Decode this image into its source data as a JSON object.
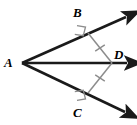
{
  "figure": {
    "kind": "geometry-diagram",
    "width": 137,
    "height": 125,
    "background_color": "#ffffff",
    "ray_color": "#1a1a1a",
    "segment_color": "#8c8c8c",
    "mark_color": "#8c8c8c",
    "label_color": "#000000"
  },
  "points": {
    "A": {
      "label": "A",
      "x": 22,
      "y": 63
    },
    "B": {
      "label": "B",
      "x": 88,
      "y": 33
    },
    "C": {
      "label": "C",
      "x": 88,
      "y": 93
    },
    "D": {
      "label": "D",
      "x": 112,
      "y": 63
    }
  },
  "rays": [
    {
      "name": "ray-AB",
      "from": "A",
      "through": "B",
      "x1": 22,
      "y1": 63,
      "x2": 131,
      "y2": 14,
      "arrow": true
    },
    {
      "name": "ray-AD",
      "from": "A",
      "through": "D",
      "x1": 22,
      "y1": 63,
      "x2": 133,
      "y2": 63,
      "arrow": true
    },
    {
      "name": "ray-AC",
      "from": "A",
      "through": "C",
      "x1": 22,
      "y1": 63,
      "x2": 131,
      "y2": 115,
      "arrow": true
    }
  ],
  "segments": [
    {
      "name": "segment-BD",
      "from": "B",
      "to": "D",
      "x1": 88,
      "y1": 33,
      "x2": 112,
      "y2": 63,
      "ticks": 1,
      "congruent": true
    },
    {
      "name": "segment-CD",
      "from": "C",
      "to": "D",
      "x1": 88,
      "y1": 93,
      "x2": 112,
      "y2": 63,
      "ticks": 1,
      "congruent": true
    }
  ],
  "right_angles": [
    {
      "name": "right-angle-at-B",
      "at": "B",
      "x": 88,
      "y": 33,
      "measure": 90
    },
    {
      "name": "right-angle-at-C",
      "at": "C",
      "x": 88,
      "y": 93,
      "measure": 90
    }
  ],
  "labels": {
    "A": "A",
    "B": "B",
    "C": "C",
    "D": "D"
  }
}
